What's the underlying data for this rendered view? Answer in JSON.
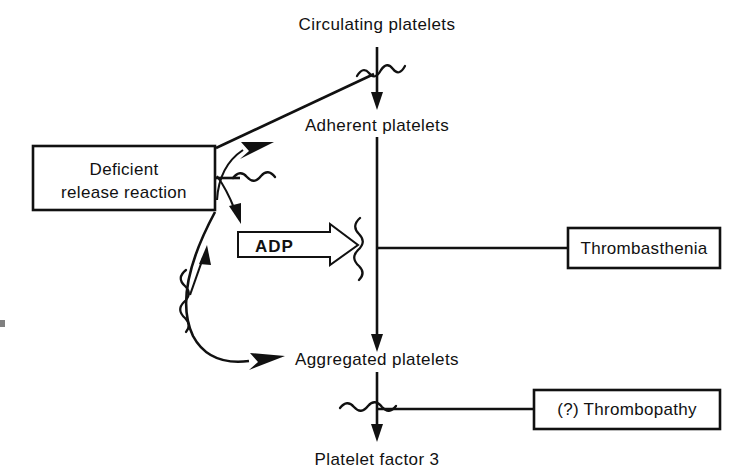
{
  "diagram": {
    "nodes": {
      "circulating": "Circulating platelets",
      "adherent": "Adherent platelets",
      "aggregated": "Aggregated platelets",
      "platelet_factor": "Platelet factor 3"
    },
    "boxes": {
      "deficient_line1": "Deficient",
      "deficient_line2": "release reaction",
      "thrombasthenia": "Thrombasthenia",
      "thrombopathy": "(?) Thrombopathy"
    },
    "mediators": {
      "adp": "ADP"
    },
    "colors": {
      "ink": "#111111",
      "paper": "#ffffff"
    },
    "symbols": {
      "block": "wavy-block-line",
      "adp_arrow": "open-block-arrow-right",
      "flow_arrow": "arrow-down",
      "inhibit_arrow": "solid-arrowhead"
    }
  }
}
